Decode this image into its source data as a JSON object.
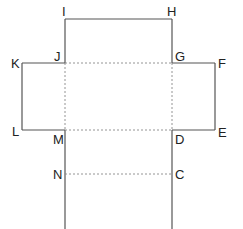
{
  "diagram": {
    "type": "net",
    "labels": {
      "I": "I",
      "H": "H",
      "J": "J",
      "G": "G",
      "K": "K",
      "F": "F",
      "L": "L",
      "E": "E",
      "M": "M",
      "D": "D",
      "N": "N",
      "C": "C"
    },
    "colors": {
      "solid": "#555555",
      "dashed": "#888888"
    }
  }
}
